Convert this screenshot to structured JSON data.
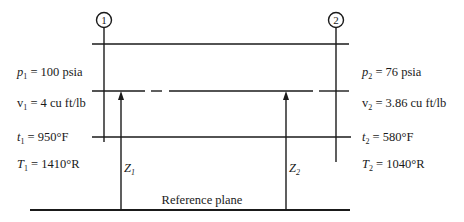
{
  "diagram": {
    "type": "flow-stations-energy-diagram",
    "stations": [
      {
        "id": "1",
        "circle_label": "1",
        "properties": {
          "pressure": {
            "symbol": "p",
            "subscript": "1",
            "text": " = 100 psia"
          },
          "specific_volume": {
            "symbol": "v",
            "subscript": "1",
            "text": " = 4 cu ft/lb"
          },
          "temperature_f": {
            "symbol": "t",
            "subscript": "1",
            "text": " = 950°F"
          },
          "temperature_r": {
            "symbol": "T",
            "subscript": "1",
            "text": " = 1410°R"
          }
        },
        "elevation_label": {
          "symbol": "Z",
          "subscript": "1"
        }
      },
      {
        "id": "2",
        "circle_label": "2",
        "properties": {
          "pressure": {
            "symbol": "p",
            "subscript": "2",
            "text": " = 76 psia"
          },
          "specific_volume": {
            "symbol": "v",
            "subscript": "2",
            "text": " = 3.86 cu ft/lb"
          },
          "temperature_f": {
            "symbol": "t",
            "subscript": "2",
            "text": " = 580°F"
          },
          "temperature_r": {
            "symbol": "T",
            "subscript": "2",
            "text": " = 1040°R"
          }
        },
        "elevation_label": {
          "symbol": "Z",
          "subscript": "2"
        }
      }
    ],
    "reference_plane_label": "Reference plane"
  }
}
